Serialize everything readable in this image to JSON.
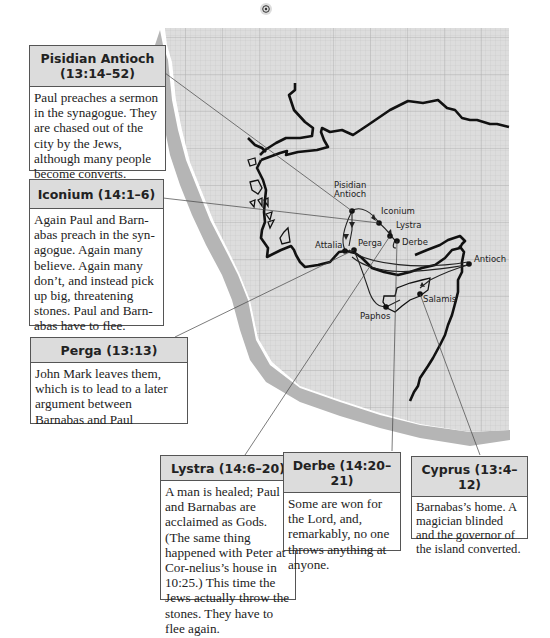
{
  "map": {
    "compass_icon": "north-marker-icon",
    "cities": [
      {
        "name": "Pisidian",
        "line2": "Antioch"
      },
      {
        "name": "Iconium"
      },
      {
        "name": "Lystra"
      },
      {
        "name": "Derbe"
      },
      {
        "name": "Attalia"
      },
      {
        "name": "Perga"
      },
      {
        "name": "Antioch"
      },
      {
        "name": "Salamis"
      },
      {
        "name": "Paphos"
      }
    ]
  },
  "callouts": {
    "pisidian_antioch": {
      "title_line1": "Pisidian Antioch",
      "title_line2": "(13:14–52)",
      "body": "Paul preaches a sermon in the synagogue. They are chased out of the city by the Jews, although many people become converts."
    },
    "iconium": {
      "title": "Iconium (14:1–6)",
      "body": "Again Paul and Barn-abas preach in the syn-agogue. Again many believe. Again many don’t, and instead pick up big, threatening stones. Paul and Barn-abas have to flee."
    },
    "perga": {
      "title": "Perga (13:13)",
      "body": "John Mark leaves them, which is to lead to a later argument between Barnabas and Paul"
    },
    "lystra": {
      "title": "Lystra (14:6–20)",
      "body": "A man is healed; Paul and Barnabas are acclaimed as Gods. (The same thing happened with Peter at Cor-nelius’s house in 10:25.) This time the Jews actually throw the stones. They have to flee again."
    },
    "derbe": {
      "title": "Derbe (14:20–21)",
      "body": "Some are won for the Lord, and, remarkably, no one throws anything at anyone."
    },
    "cyprus": {
      "title": "Cyprus (13:4–12)",
      "body": "Barnabas’s home. A magician blinded and the governor of the island converted."
    }
  }
}
